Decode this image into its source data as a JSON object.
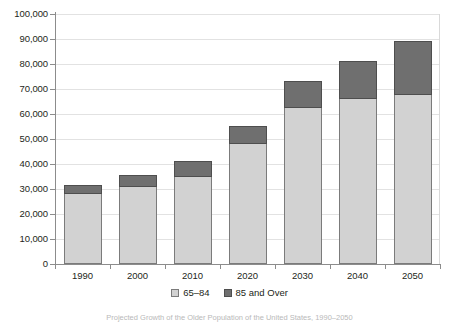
{
  "chart_data": {
    "type": "bar",
    "subtype": "stacked-vertical",
    "title": "",
    "xlabel": "",
    "ylabel": "",
    "categories": [
      "1990",
      "2000",
      "2010",
      "2020",
      "2030",
      "2040",
      "2050"
    ],
    "series": [
      {
        "name": "65–84",
        "color": "#d2d2d2",
        "values": [
          28000,
          31000,
          34800,
          48000,
          62600,
          66000,
          67500
        ]
      },
      {
        "name": "85 and Over",
        "color": "#6f6f6f",
        "values": [
          3200,
          4200,
          6200,
          7000,
          10200,
          15000,
          21200
        ]
      }
    ],
    "totals": [
      31200,
      35200,
      41000,
      55000,
      72800,
      81000,
      88700
    ],
    "ylim": [
      0,
      100000
    ],
    "ytick_values": [
      0,
      10000,
      20000,
      30000,
      40000,
      50000,
      60000,
      70000,
      80000,
      90000,
      100000
    ],
    "ytick_labels": [
      "0",
      "10,000",
      "20,000",
      "30,000",
      "40,000",
      "50,000",
      "60,000",
      "70,000",
      "80,000",
      "90,000",
      "100,000"
    ],
    "grid": true,
    "grid_axis": "y",
    "legend_position": "bottom-center",
    "legend": [
      {
        "label": "65–84",
        "color": "#d2d2d2"
      },
      {
        "label": "85 and Over",
        "color": "#6f6f6f"
      }
    ]
  },
  "caption": {
    "text": "Projected Growth of the Older Population of the United States, 1990–2050"
  },
  "colors": {
    "young_fill": "#d2d2d2",
    "old_fill": "#6f6f6f",
    "bar_stroke": "#7b7b7b",
    "axis": "#8c8c8c",
    "grid": "#e2e2e2",
    "text": "#231f20",
    "background": "#ffffff"
  }
}
